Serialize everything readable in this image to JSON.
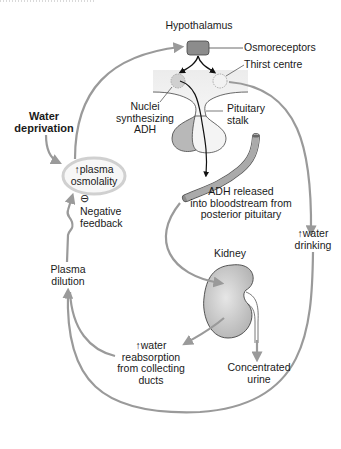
{
  "diagram": {
    "labels": {
      "hypothalamus": "Hypothalamus",
      "osmoreceptors": "Osmoreceptors",
      "thirst_centre": "Thirst centre",
      "nuclei_line1": "Nuclei",
      "nuclei_line2": "synthesizing",
      "nuclei_line3": "ADH",
      "pituitary_line1": "Pituitary",
      "pituitary_line2": "stalk",
      "water_deprivation_line1": "Water",
      "water_deprivation_line2": "deprivation",
      "plasma_osmolality_arrow": "↑",
      "plasma_osmolality_line1": "plasma",
      "plasma_osmolality_line2": "osmolality",
      "negative_symbol": "⊖",
      "negative_feedback_line1": "Negative",
      "negative_feedback_line2": "feedback",
      "adh_released_line1": "ADH released",
      "adh_released_line2": "into bloodstream from",
      "adh_released_line3": "posterior pituitary",
      "water_drinking_arrow": "↑",
      "water_drinking_line1": "water",
      "water_drinking_line2": "drinking",
      "kidney": "Kidney",
      "plasma_dilution_line1": "Plasma",
      "plasma_dilution_line2": "dilution",
      "reabsorption_arrow": "↑",
      "reabsorption_line1": "water",
      "reabsorption_line2": "reabsorption",
      "reabsorption_line3": "from collecting",
      "reabsorption_line4": "ducts",
      "concentrated_line1": "Concentrated",
      "concentrated_line2": "urine"
    },
    "colors": {
      "arrow_grey": "#9a9a9a",
      "organ_fill": "#c8c8c8",
      "osmoreceptor_fill": "#8c8c8c",
      "text": "#1a1a1a"
    }
  }
}
